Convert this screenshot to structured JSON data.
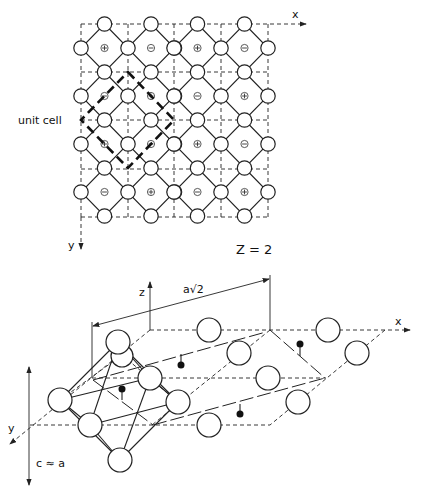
{
  "top_diagram": {
    "axis_x_label": "x",
    "axis_y_label": "y",
    "unit_cell_label": "unit cell",
    "formula_units_label": "Z = 2",
    "sign_rows": [
      [
        "+",
        "-",
        "+",
        "-"
      ],
      [
        "-",
        "+",
        "-",
        "+"
      ],
      [
        "+",
        "-",
        "+",
        "-"
      ],
      [
        "-",
        "+",
        "-",
        "+"
      ]
    ]
  },
  "bottom_diagram": {
    "axis_x_label": "x",
    "axis_y_label": "y",
    "axis_z_label": "z",
    "dimension_label": "a√2",
    "c_label": "c ≈ a"
  },
  "colors": {
    "ink": "#222222",
    "background": "#ffffff"
  }
}
